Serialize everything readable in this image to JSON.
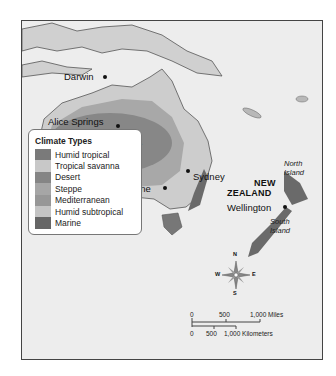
{
  "map": {
    "labels": {
      "darwin": "Darwin",
      "alice_springs": "Alice Springs",
      "australia": "AUSTRALIA",
      "perth": "Perth",
      "sydney": "Sydney",
      "melbourne": "Melbourne",
      "new": "NEW",
      "zealand": "ZEALAND",
      "wellington": "Wellington",
      "north": "North",
      "north_island": "Island",
      "south": "South",
      "south_island": "Island"
    },
    "colors": {
      "ocean": "#ededed",
      "land": "#d2d2d2",
      "humid_tropical": "#7a7a7a",
      "tropical_savanna": "#c8c8c8",
      "desert": "#8a8a8a",
      "steppe": "#a8a8a8",
      "mediterranean": "#9a9a9a",
      "humid_subtropical": "#c4c4c4",
      "marine": "#666666"
    }
  },
  "legend": {
    "title": "Climate Types",
    "items": [
      {
        "label": "Humid tropical",
        "color": "#7a7a7a"
      },
      {
        "label": "Tropical savanna",
        "color": "#c8c8c8"
      },
      {
        "label": "Desert",
        "color": "#858585"
      },
      {
        "label": "Steppe",
        "color": "#a6a6a6"
      },
      {
        "label": "Mediterranean",
        "color": "#979797"
      },
      {
        "label": "Humid subtropical",
        "color": "#c4c4c4"
      },
      {
        "label": "Marine",
        "color": "#666666"
      }
    ]
  },
  "compass": {
    "n": "N",
    "s": "S",
    "e": "E",
    "w": "W"
  },
  "scale": {
    "miles_0": "0",
    "miles_500": "500",
    "miles_1000": "1,000 Miles",
    "km_0": "0",
    "km_500": "500",
    "km_1000": "1,000 Kilometers"
  }
}
